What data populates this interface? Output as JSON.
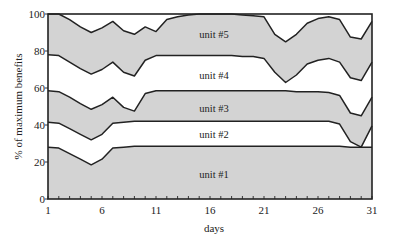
{
  "chart_data": {
    "type": "area",
    "title": "",
    "xlabel": "days",
    "ylabel": "% of maximum benefits",
    "xlim": [
      1,
      31
    ],
    "ylim": [
      0,
      100
    ],
    "x_ticks": [
      1,
      6,
      11,
      16,
      21,
      26,
      31
    ],
    "y_ticks": [
      0,
      20,
      40,
      60,
      80,
      100
    ],
    "grid": false,
    "stacked": true,
    "x": [
      1,
      2,
      3,
      4,
      5,
      6,
      7,
      8,
      9,
      10,
      11,
      12,
      13,
      14,
      15,
      16,
      17,
      18,
      19,
      20,
      21,
      22,
      23,
      24,
      25,
      26,
      27,
      28,
      29,
      30,
      31
    ],
    "series": [
      {
        "name": "unit #1",
        "fill": "#d3d3d3",
        "upper_boundary": [
          28,
          27.5,
          24.5,
          21.5,
          18.5,
          21.5,
          27.5,
          28,
          28.5,
          28.5,
          28.5,
          28.5,
          28.5,
          28.5,
          28.5,
          28.5,
          28.5,
          28.5,
          28.5,
          28.5,
          28.5,
          28.5,
          28.5,
          28.5,
          28.5,
          28.5,
          28.5,
          28.5,
          28,
          28,
          28
        ]
      },
      {
        "name": "unit #2",
        "fill": "#ffffff",
        "upper_boundary": [
          41.5,
          41,
          38,
          35,
          32,
          35,
          41,
          41.5,
          42,
          42,
          42,
          42,
          42,
          42,
          42,
          42,
          42,
          42,
          42,
          42,
          42,
          42,
          42,
          42,
          42,
          42,
          42,
          40.5,
          31,
          28,
          39.5
        ]
      },
      {
        "name": "unit #3",
        "fill": "#d3d3d3",
        "upper_boundary": [
          58.5,
          58,
          55,
          51.5,
          48.5,
          51,
          55,
          49.5,
          47.5,
          57,
          58.5,
          58.5,
          58.5,
          58.5,
          58.5,
          58.5,
          58.5,
          58.5,
          58.5,
          58.5,
          58.5,
          58.5,
          58.5,
          58,
          58,
          58,
          57.5,
          56,
          46.5,
          45,
          55
        ]
      },
      {
        "name": "unit #4",
        "fill": "#ffffff",
        "upper_boundary": [
          78,
          77.5,
          74,
          70.5,
          67.5,
          70,
          74,
          68.5,
          66.5,
          75,
          77.5,
          77.5,
          77.5,
          77.5,
          77.5,
          77.5,
          77.5,
          77.5,
          77,
          77,
          76,
          68.5,
          63,
          67,
          73,
          75,
          76,
          74,
          65.5,
          64,
          74
        ]
      },
      {
        "name": "unit #5",
        "fill": "#d3d3d3",
        "upper_boundary": [
          100,
          100,
          97,
          93,
          90,
          92.5,
          96,
          91,
          89,
          93,
          90.5,
          97,
          98.5,
          99.5,
          100,
          100,
          100,
          100,
          99.5,
          99,
          98.5,
          89,
          85,
          89,
          95,
          97.5,
          98.5,
          97,
          87.5,
          86.5,
          96
        ]
      }
    ],
    "annotations": [
      {
        "text": "unit #5",
        "x": 16,
        "y": 89
      },
      {
        "text": "unit #4",
        "x": 16,
        "y": 67
      },
      {
        "text": "unit #3",
        "x": 16,
        "y": 49
      },
      {
        "text": "unit #2",
        "x": 16,
        "y": 35
      },
      {
        "text": "unit #1",
        "x": 16,
        "y": 13
      }
    ]
  },
  "colors": {
    "fill_gray": "#d3d3d3",
    "line": "#222222",
    "background": "#ffffff"
  }
}
